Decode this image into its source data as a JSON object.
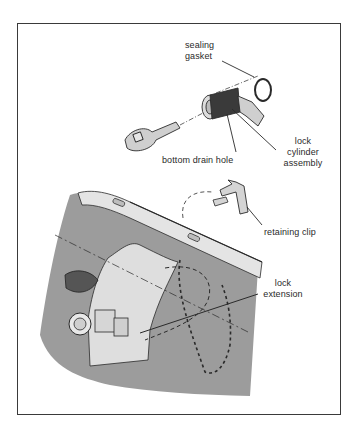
{
  "diagram": {
    "type": "exploded-assembly-illustration",
    "labels": {
      "sealing_gasket": [
        "sealing",
        "gasket"
      ],
      "lock_cylinder_assembly": [
        "lock",
        "cylinder",
        "assembly"
      ],
      "bottom_drain_hole": "bottom drain hole",
      "retaining_clip": "retaining clip",
      "lock_extension": [
        "lock",
        "extension"
      ]
    },
    "parts": [
      "key",
      "lock cylinder",
      "sealing gasket",
      "retaining clip",
      "trunk lid panel",
      "lock extension"
    ],
    "colors": {
      "frame": "#3a3a3a",
      "panel_fill": "#9a9a9a",
      "panel_light": "#dcdcdc",
      "line": "#2a2a2a"
    }
  }
}
